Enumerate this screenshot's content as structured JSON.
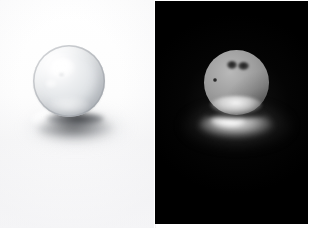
{
  "figure": {
    "width": 313,
    "height": 234,
    "panel_count": 2,
    "page_background": "#ffffff",
    "divider_x": 155
  },
  "panels": [
    {
      "id": "left",
      "name": "bright-background-panel",
      "caption": "",
      "background_kind": "white studio backdrop",
      "background_color": "#fbfbfc",
      "bounds": {
        "x": 0,
        "y": 0,
        "width": 156,
        "height": 228
      },
      "subject": {
        "name": "glass-marble",
        "kind": "transparent glass sphere",
        "center_x": 69,
        "center_y": 81,
        "radius": 36,
        "body_color": "#e0e3e6",
        "rim_color": "#9aa0a6",
        "specular_highlight": {
          "x": 50,
          "y": 58,
          "color": "#ffffff"
        },
        "blemishes": 0
      },
      "shadow": {
        "name": "cast-shadow",
        "kind": "soft cast shadow with bright caustic",
        "caustic_color": "#ffffff",
        "core_color": "#1e2024",
        "direction": "down-right"
      }
    },
    {
      "id": "right",
      "name": "dark-background-panel",
      "caption": "",
      "background_kind": "black studio backdrop",
      "background_color": "#000000",
      "bounds": {
        "x": 155,
        "y": 1,
        "width": 153,
        "height": 223
      },
      "subject": {
        "name": "glass-marble",
        "kind": "back-lit sphere showing surface defects",
        "center_x": 236,
        "center_y": 82,
        "radius": 32,
        "body_color": "#9d9d9d",
        "rim_color": "#f5f5f5",
        "specular_highlight": {
          "x": 222,
          "y": 66,
          "color": "#b9b9b9"
        },
        "blemishes": 3
      },
      "defects": [
        {
          "name": "dark-oval-blemish-left",
          "x": 232,
          "y": 65,
          "width": 10,
          "height": 8,
          "color": "#121212"
        },
        {
          "name": "dark-oval-blemish-right",
          "x": 243,
          "y": 66,
          "width": 11,
          "height": 8,
          "color": "#121212"
        },
        {
          "name": "dark-speck",
          "x": 214,
          "y": 79,
          "width": 4,
          "height": 4,
          "color": "#0c0c0c"
        }
      ],
      "shadow": {
        "name": "specular-reflection",
        "kind": "bright specular reflection on dark surface",
        "caustic_color": "#ffffff",
        "core_color": "#000000",
        "direction": "down"
      }
    }
  ]
}
